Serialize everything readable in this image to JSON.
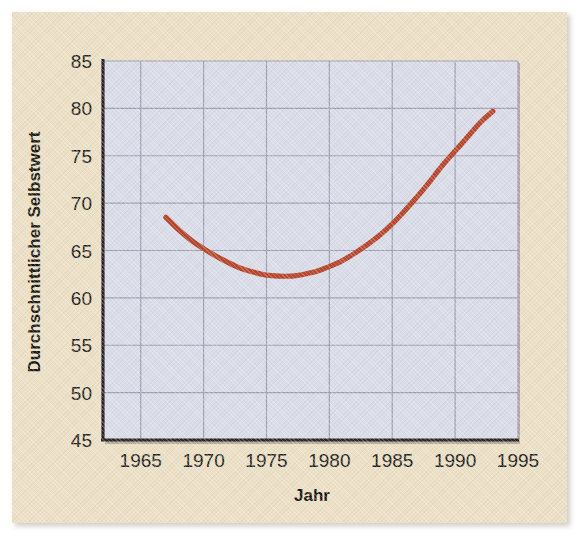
{
  "figure": {
    "background_color": "#ece0c6",
    "plot_background_color": "#d9dce9",
    "grid_color": "#9a9cb4",
    "axis_color": "#262223",
    "curve_color": "#b5442a"
  },
  "chart_data": {
    "type": "line",
    "title": "",
    "xlabel": "Jahr",
    "ylabel": "Durchschnittlicher Selbstwert",
    "xlim": [
      1962,
      1995
    ],
    "ylim": [
      45,
      85
    ],
    "xticks": [
      1965,
      1970,
      1975,
      1980,
      1985,
      1990,
      1995
    ],
    "xtick_labels": [
      "1965",
      "1970",
      "1975",
      "1980",
      "1985",
      "1990",
      "1995"
    ],
    "yticks": [
      45,
      50,
      55,
      60,
      65,
      70,
      75,
      80,
      85
    ],
    "ytick_labels": [
      "45",
      "50",
      "55",
      "60",
      "65",
      "70",
      "75",
      "80",
      "85"
    ],
    "grid": true,
    "legend": "none",
    "series": [
      {
        "name": "Durchschnittlicher Selbstwert",
        "color": "#b5442a",
        "x": [
          1967,
          1968,
          1969,
          1970,
          1971,
          1972,
          1973,
          1974,
          1975,
          1976,
          1977,
          1978,
          1979,
          1980,
          1981,
          1982,
          1983,
          1984,
          1985,
          1986,
          1987,
          1988,
          1989,
          1990,
          1991,
          1992,
          1993
        ],
        "y": [
          68.5,
          67.2,
          66.1,
          65.2,
          64.4,
          63.7,
          63.1,
          62.7,
          62.4,
          62.3,
          62.3,
          62.5,
          62.8,
          63.3,
          63.9,
          64.7,
          65.6,
          66.6,
          67.8,
          69.2,
          70.7,
          72.3,
          74.0,
          75.5,
          77.0,
          78.5,
          79.7
        ]
      }
    ]
  }
}
